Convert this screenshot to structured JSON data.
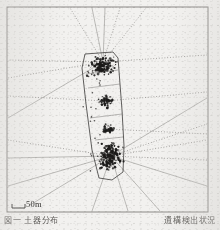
{
  "figure": {
    "kind": "scanned-spatial-plot",
    "background_color": "#f2f1ef",
    "ink_color": "#1c1b1a",
    "line_color": "#6d6b68"
  },
  "frame": {
    "name": "plot-border",
    "x": 7,
    "y": 7,
    "width": 201,
    "height": 205,
    "stroke": "#8a8885"
  },
  "scale_bar": {
    "label": "50m",
    "x": 12,
    "y": 208,
    "length": 13,
    "tick_height": 4
  },
  "caption": {
    "left_text": "図一 土器分布",
    "right_text": "遺構検出状況"
  },
  "chart_data": {
    "type": "scatter",
    "title": "",
    "xlabel": "",
    "ylabel": "",
    "xlim": [
      0,
      201
    ],
    "ylim": [
      0,
      205
    ],
    "grid": false,
    "legend": "none",
    "polygon": [
      [
        85,
        54
      ],
      [
        113,
        52
      ],
      [
        118,
        58
      ],
      [
        122,
        110
      ],
      [
        124,
        146
      ],
      [
        123,
        172
      ],
      [
        112,
        180
      ],
      [
        99,
        178
      ],
      [
        92,
        150
      ],
      [
        86,
        104
      ],
      [
        82,
        68
      ]
    ],
    "clusters": [
      {
        "name": "upper-cluster",
        "cx": 103,
        "cy": 66,
        "rx": 16,
        "ry": 11,
        "n": 130
      },
      {
        "name": "mid-cluster",
        "cx": 106,
        "cy": 101,
        "rx": 9,
        "ry": 7,
        "n": 45
      },
      {
        "name": "lower-mid-cluster",
        "cx": 108,
        "cy": 129,
        "rx": 8,
        "ry": 6,
        "n": 38
      },
      {
        "name": "lower-cluster",
        "cx": 111,
        "cy": 156,
        "rx": 13,
        "ry": 17,
        "n": 170
      }
    ],
    "rays": [
      {
        "from": [
          103,
          62
        ],
        "to": [
          70,
          8
        ],
        "style": "dotted"
      },
      {
        "from": [
          103,
          62
        ],
        "to": [
          92,
          8
        ],
        "style": "solid"
      },
      {
        "from": [
          103,
          62
        ],
        "to": [
          105,
          8
        ],
        "style": "solid"
      },
      {
        "from": [
          103,
          62
        ],
        "to": [
          120,
          8
        ],
        "style": "dotted"
      },
      {
        "from": [
          103,
          62
        ],
        "to": [
          146,
          8
        ],
        "style": "dotted"
      },
      {
        "from": [
          103,
          62
        ],
        "to": [
          8,
          78
        ],
        "style": "dotted"
      },
      {
        "from": [
          103,
          62
        ],
        "to": [
          8,
          60
        ],
        "style": "dotted"
      },
      {
        "from": [
          103,
          62
        ],
        "to": [
          8,
          118
        ],
        "style": "solid"
      },
      {
        "from": [
          103,
          62
        ],
        "to": [
          207,
          55
        ],
        "style": "dotted"
      },
      {
        "from": [
          111,
          156
        ],
        "to": [
          207,
          98
        ],
        "style": "solid"
      },
      {
        "from": [
          111,
          156
        ],
        "to": [
          207,
          124
        ],
        "style": "dotted"
      },
      {
        "from": [
          111,
          156
        ],
        "to": [
          207,
          140
        ],
        "style": "dotted"
      },
      {
        "from": [
          111,
          156
        ],
        "to": [
          207,
          160
        ],
        "style": "dotted"
      },
      {
        "from": [
          111,
          156
        ],
        "to": [
          207,
          186
        ],
        "style": "solid"
      },
      {
        "from": [
          111,
          156
        ],
        "to": [
          160,
          211
        ],
        "style": "solid"
      },
      {
        "from": [
          111,
          156
        ],
        "to": [
          128,
          211
        ],
        "style": "solid"
      },
      {
        "from": [
          111,
          156
        ],
        "to": [
          92,
          211
        ],
        "style": "solid"
      },
      {
        "from": [
          111,
          156
        ],
        "to": [
          30,
          205
        ],
        "style": "solid"
      },
      {
        "from": [
          111,
          156
        ],
        "to": [
          8,
          186
        ],
        "style": "solid"
      },
      {
        "from": [
          111,
          156
        ],
        "to": [
          8,
          158
        ],
        "style": "solid"
      },
      {
        "from": [
          111,
          156
        ],
        "to": [
          8,
          140
        ],
        "style": "dotted"
      },
      {
        "from": [
          106,
          101
        ],
        "to": [
          8,
          96
        ],
        "style": "dotted"
      },
      {
        "from": [
          106,
          101
        ],
        "to": [
          207,
          92
        ],
        "style": "dotted"
      },
      {
        "from": [
          108,
          129
        ],
        "to": [
          207,
          134
        ],
        "style": "dotted"
      }
    ]
  }
}
